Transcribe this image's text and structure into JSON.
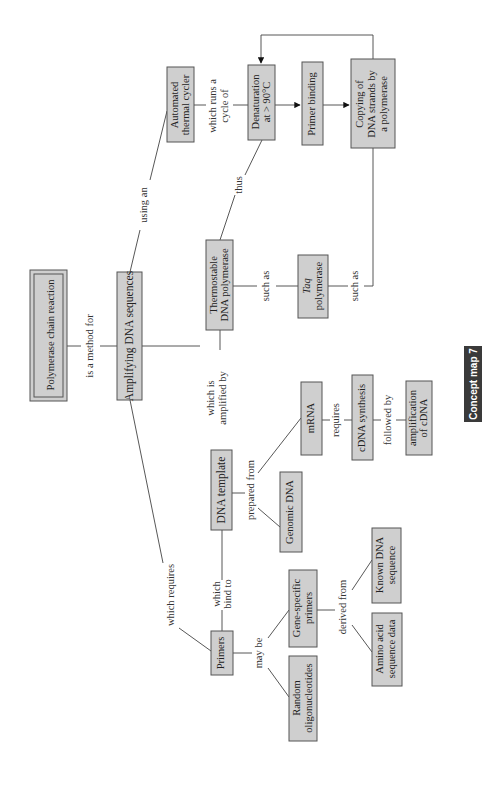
{
  "diagram": {
    "title": "Concept map 7",
    "orientation": "rotated-90-ccw",
    "colors": {
      "node_fill": "#cfcfcf",
      "node_border": "#555555",
      "edge": "#444444",
      "badge_fill": "#3a3a3a",
      "badge_text": "#ffffff"
    },
    "nodes": {
      "pcr": {
        "lines": [
          "Polymerase chain reaction"
        ]
      },
      "amplifying": {
        "lines": [
          "Amplifying DNA sequences"
        ]
      },
      "thermal_cycler": {
        "lines": [
          "Automated",
          "thermal cycler"
        ]
      },
      "denaturation": {
        "lines": [
          "Denaturation",
          "at > 90°C"
        ]
      },
      "primer_binding": {
        "lines": [
          "Primer binding"
        ]
      },
      "copying": {
        "lines": [
          "Copying of",
          "DNA strands by",
          "a polymerase"
        ]
      },
      "thermostable": {
        "lines": [
          "Thermostable",
          "DNA polymerase"
        ]
      },
      "taq": {
        "lines": [
          "Taq",
          "polymerase"
        ]
      },
      "dna_template": {
        "lines": [
          "DNA template"
        ]
      },
      "genomic_dna": {
        "lines": [
          "Genomic DNA"
        ]
      },
      "mrna": {
        "lines": [
          "mRNA"
        ]
      },
      "cdna_synthesis": {
        "lines": [
          "cDNA synthesis"
        ]
      },
      "amplification_cdna": {
        "lines": [
          "amplification",
          "of cDNA"
        ]
      },
      "primers": {
        "lines": [
          "Primers"
        ]
      },
      "random_oligos": {
        "lines": [
          "Random",
          "oligonucleotides"
        ]
      },
      "gene_specific": {
        "lines": [
          "Gene-specific",
          "primers"
        ]
      },
      "known_dna": {
        "lines": [
          "Known DNA",
          "sequence"
        ]
      },
      "amino_acid": {
        "lines": [
          "Amino acid",
          "sequence data"
        ]
      }
    },
    "links": {
      "is_a_method_for": {
        "lines": [
          "is a method for"
        ]
      },
      "using_an": {
        "lines": [
          "using an"
        ]
      },
      "which_runs": {
        "lines": [
          "which runs a",
          "cycle of"
        ]
      },
      "thus": {
        "lines": [
          "thus"
        ]
      },
      "such_as_1": {
        "lines": [
          "such as"
        ]
      },
      "such_as_2": {
        "lines": [
          "such as"
        ]
      },
      "which_is_amplified_by": {
        "lines": [
          "which is",
          "amplified by"
        ]
      },
      "which_requires": {
        "lines": [
          "which requires"
        ]
      },
      "which_bind_to": {
        "lines": [
          "which",
          "bind to"
        ]
      },
      "prepared_from": {
        "lines": [
          "prepared from"
        ]
      },
      "requires": {
        "lines": [
          "requires"
        ]
      },
      "followed_by": {
        "lines": [
          "followed by"
        ]
      },
      "may_be": {
        "lines": [
          "may be"
        ]
      },
      "derived_from": {
        "lines": [
          "derived from"
        ]
      }
    },
    "edges": [
      {
        "from": "pcr",
        "to": "amplifying",
        "label": "is a method for"
      },
      {
        "from": "amplifying",
        "to": "thermal_cycler",
        "label": "using an"
      },
      {
        "from": "thermal_cycler",
        "to": "denaturation",
        "label": "which runs a cycle of"
      },
      {
        "from": "denaturation",
        "to": "primer_binding",
        "arrow": true
      },
      {
        "from": "primer_binding",
        "to": "copying",
        "arrow": true
      },
      {
        "from": "copying",
        "to": "denaturation",
        "arrow": true
      },
      {
        "from": "amplifying",
        "to": "thermostable",
        "label": "which is amplified by"
      },
      {
        "from": "thermostable",
        "to": "denaturation",
        "label": "thus"
      },
      {
        "from": "thermostable",
        "to": "taq",
        "label": "such as"
      },
      {
        "from": "taq",
        "to": "copying",
        "label": "such as"
      },
      {
        "from": "amplifying",
        "to": "primers",
        "label": "which requires"
      },
      {
        "from": "primers",
        "to": "dna_template",
        "label": "which bind to"
      },
      {
        "from": "dna_template",
        "to": "genomic_dna",
        "label": "prepared from"
      },
      {
        "from": "dna_template",
        "to": "mrna",
        "label": "prepared from"
      },
      {
        "from": "mrna",
        "to": "cdna_synthesis",
        "label": "requires"
      },
      {
        "from": "cdna_synthesis",
        "to": "amplification_cdna",
        "label": "followed by"
      },
      {
        "from": "primers",
        "to": "random_oligos",
        "label": "may be"
      },
      {
        "from": "primers",
        "to": "gene_specific",
        "label": "may be"
      },
      {
        "from": "gene_specific",
        "to": "known_dna",
        "label": "derived from"
      },
      {
        "from": "gene_specific",
        "to": "amino_acid",
        "label": "derived from"
      }
    ]
  }
}
